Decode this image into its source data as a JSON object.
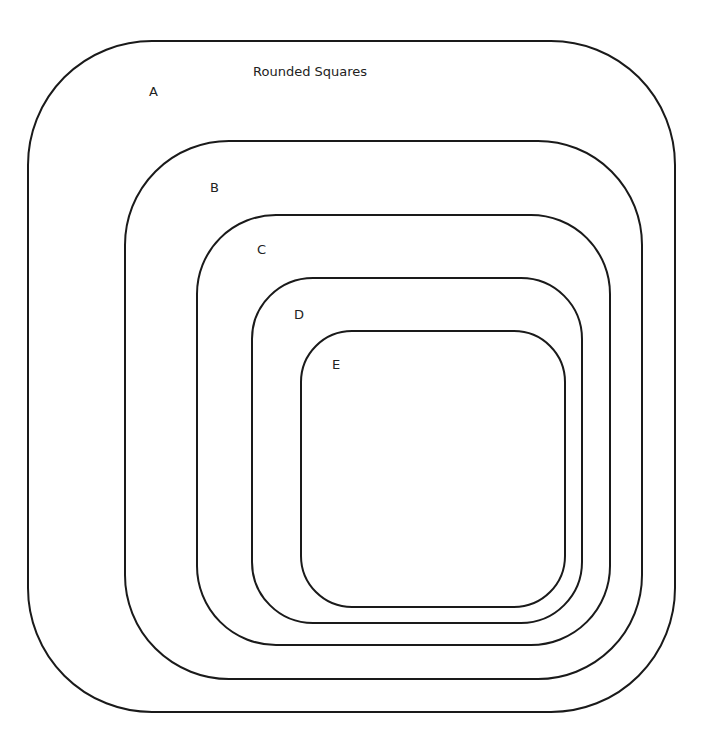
{
  "diagram": {
    "title": "Rounded Squares",
    "shapes": [
      {
        "id": "A",
        "label": "A"
      },
      {
        "id": "B",
        "label": "B"
      },
      {
        "id": "C",
        "label": "C"
      },
      {
        "id": "D",
        "label": "D"
      },
      {
        "id": "E",
        "label": "E"
      }
    ],
    "stroke_color": "#1a1a1a",
    "background": "#ffffff"
  }
}
